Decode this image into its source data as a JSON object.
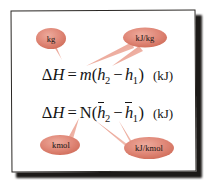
{
  "figure": {
    "kind": "equation-figure-with-callouts",
    "background_color": "#ffffff",
    "frame_color": "#2a2724",
    "bubble_color": "#e08878",
    "bubble_edge_color": "#c4604f",
    "text_color": "#141414"
  },
  "equations": [
    {
      "id": "enthalpy-mass-basis",
      "lhs_delta": "Δ",
      "lhs_symbol": "H",
      "equals": "=",
      "coefficient": "m",
      "open_paren": "(",
      "term1_symbol": "h",
      "term1_subscript": "2",
      "operator": "−",
      "term2_symbol": "h",
      "term2_subscript": "1",
      "close_paren": ")",
      "unit": "(kJ)",
      "plain": "ΔH = m(h2 − h1)  (kJ)"
    },
    {
      "id": "enthalpy-mole-basis",
      "lhs_delta": "Δ",
      "lhs_symbol": "H",
      "equals": "=",
      "coefficient": "N",
      "open_paren": "(",
      "term1_symbol": "h",
      "term1_subscript": "2",
      "operator": "−",
      "term2_symbol": "h",
      "term2_subscript": "1",
      "close_paren": ")",
      "unit": "(kJ)",
      "plain": "ΔH = N(h̅2 − h̅1)  (kJ)"
    }
  ],
  "callouts": [
    {
      "id": "callout-kg",
      "label": "kg",
      "points_to": "m",
      "position": "upper-left",
      "color": "#e08878"
    },
    {
      "id": "callout-kj-per-kg",
      "label": "kJ/kg",
      "points_to": "h2 and h1",
      "position": "upper-right",
      "color": "#e08878"
    },
    {
      "id": "callout-kmol",
      "label": "kmol",
      "points_to": "N",
      "position": "lower-left",
      "color": "#e08878"
    },
    {
      "id": "callout-kj-per-kmol",
      "label": "kJ/kmol",
      "points_to": "h-bar 2 and h-bar 1",
      "position": "lower-right",
      "color": "#e08878"
    }
  ]
}
